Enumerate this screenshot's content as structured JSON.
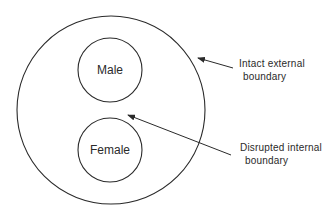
{
  "diagram": {
    "outer_circle": {
      "cx": 111,
      "cy": 110,
      "r": 94
    },
    "inner_circles": [
      {
        "label": "Male",
        "cx": 110,
        "cy": 70,
        "r": 32
      },
      {
        "label": "Female",
        "cx": 110,
        "cy": 150,
        "r": 32
      }
    ],
    "annotations": [
      {
        "line1": "Intact external",
        "line2": "boundary",
        "arrow": {
          "from": [
            233,
            68
          ],
          "to": [
            198,
            58
          ]
        }
      },
      {
        "line1": "Disrupted internal",
        "line2": "boundary",
        "arrow": {
          "from": [
            231,
            155
          ],
          "to": [
            128,
            115
          ]
        }
      }
    ],
    "stroke_color": "#2a2a2a"
  }
}
